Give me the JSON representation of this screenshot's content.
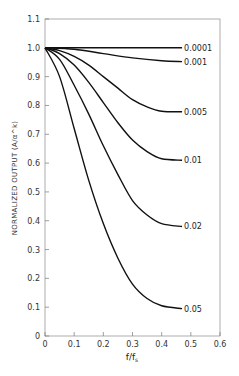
{
  "chart_data": {
    "type": "line",
    "title": "",
    "xlabel": "f/f_s",
    "ylabel": "NORMALIZED OUTPUT (A/α^k)",
    "xlim": [
      0,
      0.6
    ],
    "ylim": [
      0,
      1.1
    ],
    "xticks": [
      "0",
      "0.1",
      "0.2",
      "0.3",
      "0.4",
      "0.5",
      "0.6"
    ],
    "yticks": [
      "0",
      "0.1",
      "0.2",
      "0.3",
      "0.4",
      "0.5",
      "0.6",
      "0.7",
      "0.8",
      "0.9",
      "1.0",
      "1.1"
    ],
    "grid": false,
    "legend": "inline labels at curve ends",
    "series": [
      {
        "name": "0.0001",
        "x": [
          0,
          0.1,
          0.2,
          0.3,
          0.4,
          0.47
        ],
        "y": [
          1.0,
          1.0,
          1.0,
          1.0,
          1.0,
          1.0
        ]
      },
      {
        "name": "0.001",
        "x": [
          0,
          0.1,
          0.2,
          0.3,
          0.4,
          0.47
        ],
        "y": [
          1.0,
          0.995,
          0.98,
          0.965,
          0.955,
          0.952
        ]
      },
      {
        "name": "0.005",
        "x": [
          0,
          0.05,
          0.1,
          0.15,
          0.2,
          0.25,
          0.3,
          0.35,
          0.4,
          0.47
        ],
        "y": [
          1.0,
          0.99,
          0.97,
          0.94,
          0.9,
          0.86,
          0.82,
          0.795,
          0.78,
          0.778
        ]
      },
      {
        "name": "0.01",
        "x": [
          0,
          0.05,
          0.1,
          0.15,
          0.2,
          0.25,
          0.3,
          0.35,
          0.4,
          0.47
        ],
        "y": [
          1.0,
          0.98,
          0.94,
          0.88,
          0.81,
          0.74,
          0.68,
          0.64,
          0.615,
          0.61
        ]
      },
      {
        "name": "0.02",
        "x": [
          0,
          0.05,
          0.1,
          0.15,
          0.2,
          0.25,
          0.3,
          0.35,
          0.4,
          0.47
        ],
        "y": [
          1.0,
          0.96,
          0.87,
          0.77,
          0.66,
          0.56,
          0.47,
          0.42,
          0.39,
          0.38
        ]
      },
      {
        "name": "0.05",
        "x": [
          0,
          0.05,
          0.1,
          0.15,
          0.2,
          0.25,
          0.3,
          0.35,
          0.4,
          0.47
        ],
        "y": [
          1.0,
          0.9,
          0.72,
          0.54,
          0.39,
          0.27,
          0.18,
          0.13,
          0.105,
          0.095
        ]
      }
    ]
  }
}
